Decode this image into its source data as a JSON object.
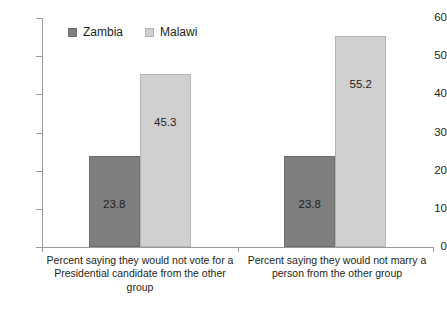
{
  "chart_data": {
    "type": "bar",
    "title": "",
    "subtitle": "",
    "xlabel": "",
    "ylabel": "",
    "ylim": [
      0,
      60
    ],
    "yticks": [
      0,
      10,
      20,
      30,
      40,
      50,
      60
    ],
    "grid": false,
    "legend_position": "top-left-inside",
    "categories": [
      "Percent saying they would not vote for a Presidential candidate from the other group",
      "Percent saying they would not marry a person from the other group"
    ],
    "series": [
      {
        "name": "Zambia",
        "color": "#7f7f7f",
        "values": [
          23.8,
          23.8
        ],
        "labels": [
          "23.8",
          "23.8"
        ]
      },
      {
        "name": "Malawi",
        "color": "#d0d0d0",
        "values": [
          45.3,
          55.2
        ],
        "labels": [
          "45.3",
          "55.2"
        ]
      }
    ]
  },
  "axis": {
    "y_tick_labels": [
      "0",
      "10",
      "20",
      "30",
      "40",
      "50",
      "60"
    ]
  },
  "legend": {
    "items": [
      {
        "label": "Zambia",
        "swatch": "legend-swatch-zambia"
      },
      {
        "label": "Malawi",
        "swatch": "legend-swatch-malawi"
      }
    ]
  },
  "category_labels": [
    "Percent saying they would not vote for a Presidential candidate from the other group",
    "Percent saying they would not marry a person from the other group"
  ]
}
